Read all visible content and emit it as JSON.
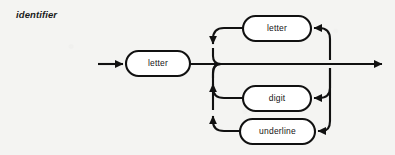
{
  "diagram": {
    "kind": "railroad-syntax-diagram",
    "rule_name": "identifier",
    "stroke_color": "#111111",
    "node_fill_color": "#ffffff",
    "background_color": "#f4f4f2",
    "nodes": [
      {
        "id": "first-letter",
        "label": "letter",
        "shape": "stadium",
        "x": 126,
        "y": 51,
        "w": 64,
        "h": 25
      },
      {
        "id": "loop-letter",
        "label": "letter",
        "shape": "stadium",
        "x": 243,
        "y": 16,
        "w": 68,
        "h": 25
      },
      {
        "id": "loop-digit",
        "label": "digit",
        "shape": "stadium",
        "x": 243,
        "y": 86,
        "w": 68,
        "h": 25
      },
      {
        "id": "loop-underline",
        "label": "underline",
        "shape": "stadium",
        "x": 240,
        "y": 119,
        "w": 75,
        "h": 25
      }
    ],
    "entry_arrow": {
      "from_x": 98,
      "to_x": 126,
      "y": 64,
      "direction": "right"
    },
    "exit_arrow": {
      "from_x": 330,
      "to_x": 385,
      "y": 64,
      "direction": "right"
    },
    "fork_bar_x": 213,
    "join_bar_x": 330,
    "main_line_y": 64,
    "arrowheads": [
      {
        "id": "entry",
        "x": 126,
        "y": 64,
        "direction": "right"
      },
      {
        "id": "exit",
        "x": 385,
        "y": 64,
        "direction": "right"
      },
      {
        "id": "letter-loop-return",
        "x": 213,
        "y": 46,
        "direction": "down"
      },
      {
        "id": "digit-loop-return",
        "x": 213,
        "y": 80,
        "direction": "up"
      },
      {
        "id": "underline-loop-return",
        "x": 213,
        "y": 112,
        "direction": "up"
      },
      {
        "id": "letter-loop-feed",
        "x": 311,
        "y": 28,
        "direction": "left"
      },
      {
        "id": "digit-loop-feed",
        "x": 311,
        "y": 98,
        "direction": "left"
      },
      {
        "id": "underline-loop-feed",
        "x": 315,
        "y": 131,
        "direction": "left"
      }
    ]
  }
}
